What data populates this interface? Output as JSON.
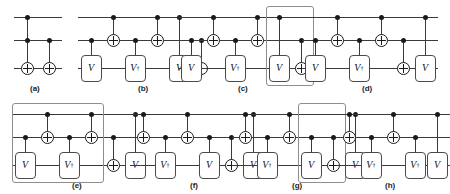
{
  "figure": {
    "wire_count": 3,
    "colors": {
      "wire": "#3a3a3a",
      "ink": "#1a1a1a",
      "gate_border": "#4a4a4a",
      "highlight": "#8e8e8e",
      "background": "#ffffff"
    },
    "gate_labels": {
      "v": "V",
      "v_dagger": "V",
      "dagger_mark": "†"
    },
    "panels": [
      {
        "id": "a",
        "caption": "(a)",
        "row": "top",
        "gates": [
          {
            "type": "cnot",
            "control_wires": [
              1,
              2
            ],
            "target_wire": 3,
            "label": ""
          },
          {
            "type": "cnot",
            "control_wires": [
              2
            ],
            "target_wire": 3,
            "label": ""
          }
        ],
        "highlight": null
      },
      {
        "id": "b",
        "caption": "(b)",
        "row": "top",
        "gates": [
          {
            "type": "box",
            "control_wires": [
              2
            ],
            "target_wire": 3,
            "label": "V"
          },
          {
            "type": "cnot",
            "control_wires": [
              1
            ],
            "target_wire": 2,
            "label": ""
          },
          {
            "type": "box",
            "control_wires": [
              2
            ],
            "target_wire": 3,
            "label": "V†"
          },
          {
            "type": "cnot",
            "control_wires": [
              1
            ],
            "target_wire": 2,
            "label": ""
          },
          {
            "type": "box",
            "control_wires": [
              1
            ],
            "target_wire": 3,
            "label": "V"
          },
          {
            "type": "cnot",
            "control_wires": [
              2
            ],
            "target_wire": 3,
            "label": ""
          }
        ],
        "highlight": null
      },
      {
        "id": "c",
        "caption": "(c)",
        "row": "top",
        "gates": [
          {
            "type": "box",
            "control_wires": [
              2
            ],
            "target_wire": 3,
            "label": "V"
          },
          {
            "type": "cnot",
            "control_wires": [
              1
            ],
            "target_wire": 2,
            "label": ""
          },
          {
            "type": "box",
            "control_wires": [
              2
            ],
            "target_wire": 3,
            "label": "V†"
          },
          {
            "type": "cnot",
            "control_wires": [
              1
            ],
            "target_wire": 2,
            "label": ""
          },
          {
            "type": "box",
            "control_wires": [
              1
            ],
            "target_wire": 3,
            "label": "V"
          },
          {
            "type": "cnot",
            "control_wires": [
              2
            ],
            "target_wire": 3,
            "label": ""
          }
        ],
        "highlight": {
          "from_gate": 4,
          "to_gate": 5
        }
      },
      {
        "id": "d",
        "caption": "(d)",
        "row": "top",
        "gates": [
          {
            "type": "box",
            "control_wires": [
              2
            ],
            "target_wire": 3,
            "label": "V"
          },
          {
            "type": "cnot",
            "control_wires": [
              1
            ],
            "target_wire": 2,
            "label": ""
          },
          {
            "type": "box",
            "control_wires": [
              2
            ],
            "target_wire": 3,
            "label": "V†"
          },
          {
            "type": "cnot",
            "control_wires": [
              1
            ],
            "target_wire": 2,
            "label": ""
          },
          {
            "type": "cnot",
            "control_wires": [
              2
            ],
            "target_wire": 3,
            "label": ""
          },
          {
            "type": "box",
            "control_wires": [
              1
            ],
            "target_wire": 3,
            "label": "V"
          }
        ],
        "highlight": null
      },
      {
        "id": "e",
        "caption": "(e)",
        "row": "bottom",
        "gates": [
          {
            "type": "box",
            "control_wires": [
              2
            ],
            "target_wire": 3,
            "label": "V"
          },
          {
            "type": "cnot",
            "control_wires": [
              1
            ],
            "target_wire": 2,
            "label": ""
          },
          {
            "type": "box",
            "control_wires": [
              2
            ],
            "target_wire": 3,
            "label": "V†"
          },
          {
            "type": "cnot",
            "control_wires": [
              1
            ],
            "target_wire": 2,
            "label": ""
          },
          {
            "type": "cnot",
            "control_wires": [
              2
            ],
            "target_wire": 3,
            "label": ""
          },
          {
            "type": "box",
            "control_wires": [
              1
            ],
            "target_wire": 3,
            "label": "V"
          }
        ],
        "highlight": {
          "from_gate": 0,
          "to_gate": 3
        }
      },
      {
        "id": "f",
        "caption": "(f)",
        "row": "bottom",
        "gates": [
          {
            "type": "cnot",
            "control_wires": [
              1
            ],
            "target_wire": 2,
            "label": ""
          },
          {
            "type": "box",
            "control_wires": [
              2
            ],
            "target_wire": 3,
            "label": "V†"
          },
          {
            "type": "cnot",
            "control_wires": [
              1
            ],
            "target_wire": 2,
            "label": ""
          },
          {
            "type": "box",
            "control_wires": [
              2
            ],
            "target_wire": 3,
            "label": "V"
          },
          {
            "type": "cnot",
            "control_wires": [
              2
            ],
            "target_wire": 3,
            "label": ""
          },
          {
            "type": "box",
            "control_wires": [
              1
            ],
            "target_wire": 3,
            "label": "V"
          }
        ],
        "highlight": null
      },
      {
        "id": "g",
        "caption": "(g)",
        "row": "bottom",
        "gates": [
          {
            "type": "cnot",
            "control_wires": [
              1
            ],
            "target_wire": 2,
            "label": ""
          },
          {
            "type": "box",
            "control_wires": [
              2
            ],
            "target_wire": 3,
            "label": "V†"
          },
          {
            "type": "cnot",
            "control_wires": [
              1
            ],
            "target_wire": 2,
            "label": ""
          },
          {
            "type": "box",
            "control_wires": [
              2
            ],
            "target_wire": 3,
            "label": "V"
          },
          {
            "type": "cnot",
            "control_wires": [
              2
            ],
            "target_wire": 3,
            "label": ""
          },
          {
            "type": "box",
            "control_wires": [
              1
            ],
            "target_wire": 3,
            "label": "V"
          }
        ],
        "highlight": {
          "from_gate": 3,
          "to_gate": 4
        }
      },
      {
        "id": "h",
        "caption": "(h)",
        "row": "bottom",
        "gates": [
          {
            "type": "cnot",
            "control_wires": [
              1
            ],
            "target_wire": 2,
            "label": ""
          },
          {
            "type": "box",
            "control_wires": [
              2
            ],
            "target_wire": 3,
            "label": "V†"
          },
          {
            "type": "cnot",
            "control_wires": [
              1
            ],
            "target_wire": 2,
            "label": ""
          },
          {
            "type": "box",
            "control_wires": [
              2
            ],
            "target_wire": 3,
            "label": "V†"
          },
          {
            "type": "box",
            "control_wires": [
              1
            ],
            "target_wire": 3,
            "label": "V"
          }
        ],
        "highlight": null
      }
    ]
  }
}
